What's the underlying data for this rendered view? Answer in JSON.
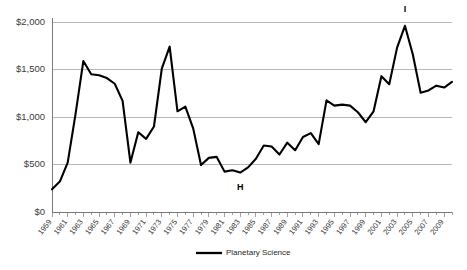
{
  "chart_data": {
    "type": "line",
    "title": "",
    "subtitle": "",
    "xlabel": "",
    "ylabel": "",
    "grid": true,
    "legend_position": "bottom-center",
    "xlim": [
      1959,
      2010
    ],
    "ylim": [
      0,
      2000
    ],
    "ytick_labels": [
      "$2,000",
      "$1,500",
      "$1,000",
      "$500",
      "$0"
    ],
    "ytick_values": [
      2000,
      1500,
      1000,
      500,
      0
    ],
    "xtick_labels": [
      "1959",
      "1961",
      "1963",
      "1965",
      "1967",
      "1969",
      "1971",
      "1973",
      "1975",
      "1977",
      "1979",
      "1981",
      "1983",
      "1985",
      "1987",
      "1989",
      "1991",
      "1993",
      "1995",
      "1997",
      "1999",
      "2001",
      "2003",
      "2005",
      "2007",
      "2009"
    ],
    "xtick_values": [
      1959,
      1961,
      1963,
      1965,
      1967,
      1969,
      1971,
      1973,
      1975,
      1977,
      1979,
      1981,
      1983,
      1985,
      1987,
      1989,
      1991,
      1993,
      1995,
      1997,
      1999,
      2001,
      2003,
      2005,
      2007,
      2009
    ],
    "annotations": [
      {
        "text": "H",
        "x": 1983,
        "y": 420,
        "placement": "below"
      },
      {
        "text": "I",
        "x": 2004,
        "y": 1960,
        "placement": "above"
      }
    ],
    "series": [
      {
        "name": "Planetary Science",
        "color": "#000000",
        "x": [
          1959,
          1960,
          1961,
          1962,
          1963,
          1964,
          1965,
          1966,
          1967,
          1968,
          1969,
          1970,
          1971,
          1972,
          1973,
          1974,
          1975,
          1976,
          1977,
          1978,
          1979,
          1980,
          1981,
          1982,
          1983,
          1984,
          1985,
          1986,
          1987,
          1988,
          1989,
          1990,
          1991,
          1992,
          1993,
          1994,
          1995,
          1996,
          1997,
          1998,
          1999,
          2000,
          2001,
          2002,
          2003,
          2004,
          2005,
          2006,
          2007,
          2008,
          2009,
          2010
        ],
        "values": [
          240,
          320,
          520,
          1030,
          1590,
          1450,
          1440,
          1410,
          1350,
          1170,
          520,
          840,
          770,
          900,
          1510,
          1740,
          1060,
          1110,
          880,
          495,
          570,
          580,
          425,
          440,
          415,
          470,
          560,
          700,
          690,
          605,
          730,
          650,
          790,
          830,
          715,
          1175,
          1120,
          1130,
          1120,
          1050,
          945,
          1060,
          1430,
          1345,
          1730,
          1960,
          1660,
          1255,
          1280,
          1330,
          1310,
          1370
        ]
      }
    ]
  },
  "legend": {
    "entries": [
      {
        "label": "Planetary Science",
        "color": "#000000"
      }
    ]
  }
}
